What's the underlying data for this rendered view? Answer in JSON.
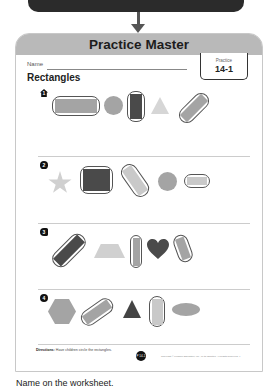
{
  "header": {
    "title": "Practice Master",
    "practice_label": "Practice",
    "practice_number": "14-1"
  },
  "worksheet": {
    "name_label": "Name",
    "title": "Rectangles",
    "problems": [
      {
        "marker_icon": "house-icon",
        "marker_number": "1",
        "shapes": [
          "rectangle (circled)",
          "circle",
          "rectangle (circled)",
          "triangle",
          "rectangle (circled)"
        ]
      },
      {
        "marker_icon": "apple-icon",
        "marker_number": "2",
        "shapes": [
          "star",
          "rectangle (circled)",
          "rectangle (circled)",
          "circle",
          "rectangle (circled)"
        ]
      },
      {
        "marker_icon": "fish-icon",
        "marker_number": "3",
        "shapes": [
          "rectangle (circled)",
          "trapezoid",
          "rectangle (circled)",
          "heart",
          "rectangle (circled)"
        ]
      },
      {
        "marker_icon": "heart-icon",
        "marker_number": "4",
        "shapes": [
          "hexagon",
          "rectangle (circled)",
          "triangle",
          "rectangle (circled)",
          "oval"
        ]
      }
    ],
    "directions_label": "Directions:",
    "directions_text": "Have children circle the rectangles.",
    "page_badge": "P 14-1",
    "copyright": "Copyright © Pearson Education, Inc., or its affiliates. All Rights Reserved. 4"
  },
  "caption": "Name on the worksheet."
}
